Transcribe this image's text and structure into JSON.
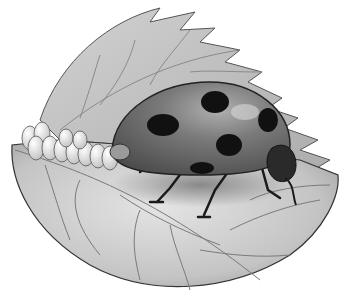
{
  "image": {
    "subject": "Ladybug laying eggs on a leaf",
    "style": "grayscale illustration",
    "colors": {
      "background": "#ffffff",
      "leaf_light": "#d9d9d9",
      "leaf_mid": "#b5b5b5",
      "leaf_dark": "#8c8c8c",
      "vein": "#7a7a7a",
      "shell": "#6e6e6e",
      "shell_highlight": "#a8a8a8",
      "spot": "#111111",
      "egg": "#f2f2f2",
      "outline": "#333333"
    },
    "ladybug": {
      "spots_visible": 5
    },
    "eggs": {
      "count_visible": 9
    }
  }
}
